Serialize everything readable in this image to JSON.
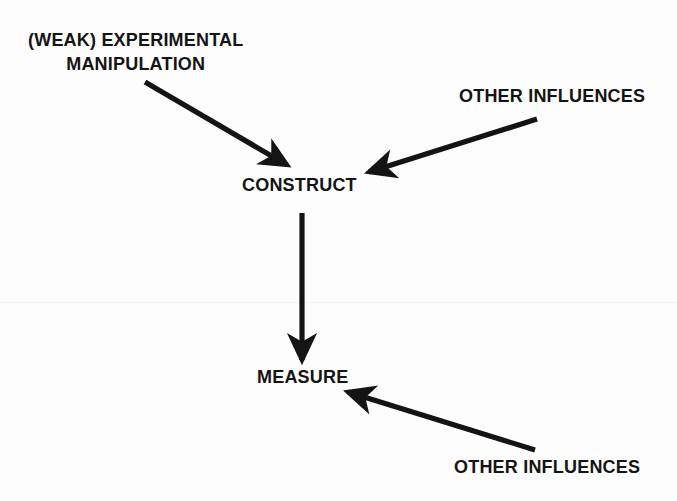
{
  "canvas": {
    "width": 677,
    "height": 501,
    "background": "#fdfdfd",
    "ink_color": "#141414"
  },
  "diagram": {
    "type": "path-diagram",
    "title_text": "",
    "nodes": [
      {
        "id": "manipulation",
        "label_line1": "(WEAK) EXPERIMENTAL",
        "label_line2": "MANIPULATION",
        "label": "(WEAK) EXPERIMENTAL MANIPULATION",
        "x": 140,
        "y": 52
      },
      {
        "id": "other-influences-top",
        "label": "OTHER INFLUENCES",
        "x": 552,
        "y": 97
      },
      {
        "id": "construct",
        "label": "CONSTRUCT",
        "x": 302,
        "y": 188
      },
      {
        "id": "measure",
        "label": "MEASURE",
        "x": 304,
        "y": 380
      },
      {
        "id": "other-influences-bottom",
        "label": "OTHER INFLUENCES",
        "x": 549,
        "y": 470
      }
    ],
    "arrows": [
      {
        "id": "manipulation-to-construct",
        "from": "manipulation",
        "to": "construct",
        "x1": 145,
        "y1": 82,
        "x2": 289,
        "y2": 166
      },
      {
        "id": "other-influences-top-to-construct",
        "from": "other-influences-top",
        "to": "construct",
        "x1": 537,
        "y1": 119,
        "x2": 366,
        "y2": 173
      },
      {
        "id": "construct-to-measure",
        "from": "construct",
        "to": "measure",
        "x1": 302,
        "y1": 213,
        "x2": 302,
        "y2": 364
      },
      {
        "id": "other-influences-bottom-to-measure",
        "from": "other-influences-bottom",
        "to": "measure",
        "x1": 535,
        "y1": 450,
        "x2": 344,
        "y2": 391
      }
    ]
  }
}
